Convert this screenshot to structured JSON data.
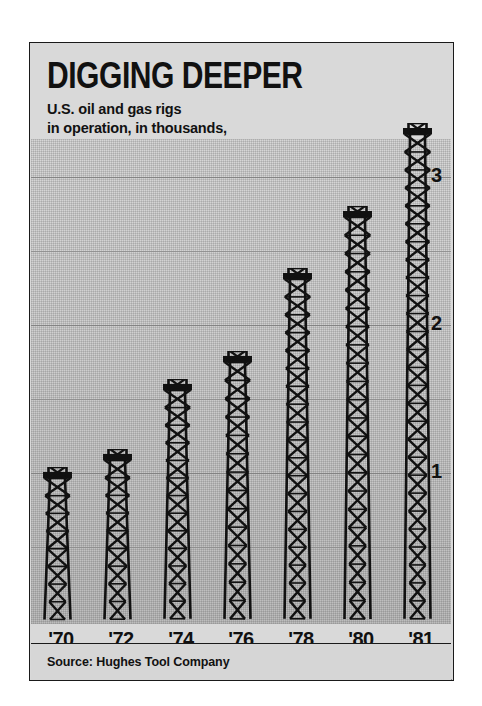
{
  "header": {
    "title": "DIGGING DEEPER",
    "subtitle": "U.S. oil and gas rigs\nin operation, in thousands,\nyearly averages"
  },
  "footer": {
    "source": "Source: Hughes Tool Company"
  },
  "chart_data": {
    "type": "bar",
    "title": "DIGGING DEEPER",
    "subtitle": "U.S. oil and gas rigs in operation, in thousands, yearly averages",
    "categories": [
      "'70",
      "'72",
      "'74",
      "'76",
      "'78",
      "'80",
      "'81"
    ],
    "category_notes": [
      "",
      "",
      "",
      "",
      "",
      "",
      "(April)"
    ],
    "values": [
      1.03,
      1.15,
      1.62,
      1.81,
      2.37,
      2.79,
      3.35
    ],
    "xlabel": "",
    "ylabel": "thousands of rigs",
    "ylim": [
      0,
      3.6
    ],
    "yticks": [
      1,
      2,
      3
    ],
    "ytick_labels": [
      "1",
      "2",
      "3"
    ],
    "minor_gridlines": [
      0.5,
      1.5,
      2.5
    ],
    "grid": true,
    "legend": false,
    "bar_glyph": "oil-derrick",
    "source": "Source: Hughes Tool Company"
  },
  "style": {
    "panel_bg": "#d9d9d9",
    "plot_bg": "#cfcfcf",
    "ink": "#111111",
    "gridline": "#8d8d8d",
    "ground_bg": "#d3d3d3"
  }
}
